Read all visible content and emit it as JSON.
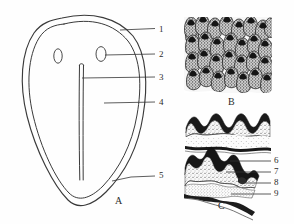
{
  "figure": {
    "background_color": "#fefefe",
    "ink_color": "#2b2b2b",
    "width": 294,
    "height": 224,
    "panels": [
      {
        "id": "A",
        "label": "A",
        "x": 115,
        "y": 196,
        "description": "outline-of-tongue-dorsum-with-median-sulcus"
      },
      {
        "id": "B",
        "label": "B",
        "x": 228,
        "y": 97,
        "description": "dense-field-of-filiform-papillae-surface-view"
      },
      {
        "id": "C",
        "label": "C",
        "x": 218,
        "y": 201,
        "description": "sagittal-section-of-mucosa-showing-layers"
      }
    ],
    "callouts": [
      {
        "label": "1",
        "x": 159,
        "y": 26,
        "leader": {
          "x1": 120,
          "y1": 29,
          "x2": 155,
          "y2": 29
        }
      },
      {
        "label": "2",
        "x": 159,
        "y": 51,
        "leader": {
          "x1": 104,
          "y1": 55,
          "x2": 155,
          "y2": 55
        }
      },
      {
        "label": "3",
        "x": 159,
        "y": 74,
        "leader": {
          "x1": 80,
          "y1": 78,
          "x2": 155,
          "y2": 78
        }
      },
      {
        "label": "4",
        "x": 159,
        "y": 99,
        "leader": {
          "x1": 104,
          "y1": 103,
          "x2": 155,
          "y2": 103
        }
      },
      {
        "label": "5",
        "x": 159,
        "y": 172,
        "leader": {
          "x1": 112,
          "y1": 180,
          "x2": 155,
          "y2": 176
        }
      },
      {
        "label": "6",
        "x": 274,
        "y": 158,
        "leader": {
          "x1": 232,
          "y1": 162,
          "x2": 271,
          "y2": 162
        }
      },
      {
        "label": "7",
        "x": 274,
        "y": 169,
        "leader": {
          "x1": 228,
          "y1": 173,
          "x2": 271,
          "y2": 173
        }
      },
      {
        "label": "8",
        "x": 274,
        "y": 180,
        "leader": {
          "x1": 238,
          "y1": 184,
          "x2": 271,
          "y2": 184
        }
      },
      {
        "label": "9",
        "x": 274,
        "y": 191,
        "leader": {
          "x1": 232,
          "y1": 194,
          "x2": 271,
          "y2": 194
        }
      }
    ],
    "panel_a_marks": [
      {
        "name": "oval-mark-left",
        "cx": 58,
        "cy": 56,
        "rx": 4,
        "ry": 7
      },
      {
        "name": "oval-mark-right",
        "cx": 101,
        "cy": 54,
        "rx": 5,
        "ry": 7
      }
    ]
  }
}
